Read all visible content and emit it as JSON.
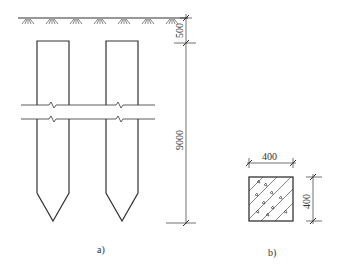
{
  "figure_a": {
    "caption": "a)",
    "dimensions": {
      "embed_depth": "500",
      "pile_length": "9000"
    },
    "piles": [
      {
        "name": "left-pile"
      },
      {
        "name": "right-pile"
      }
    ]
  },
  "figure_b": {
    "caption": "b)",
    "dimensions": {
      "width": "400",
      "height": "400"
    },
    "section": "reinforced-concrete-square-section"
  },
  "colors": {
    "line": "#333333",
    "background": "#ffffff"
  }
}
